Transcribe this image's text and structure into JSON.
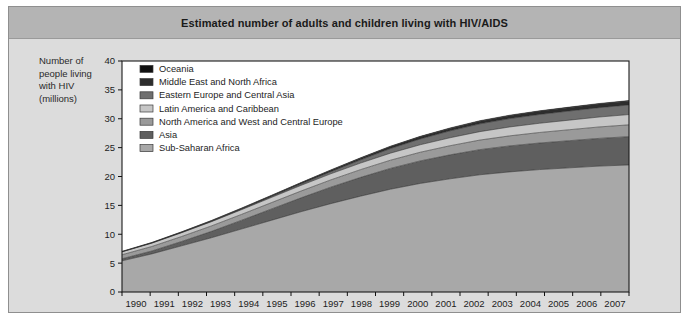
{
  "figure": {
    "title": "Estimated number of adults and children living with HIV/AIDS",
    "background_color": "#dcdcdc",
    "title_band_color": "#b4b4b4",
    "border_color": "#8f8f8f"
  },
  "axis": {
    "ylabel_line1": "Number of",
    "ylabel_line2": "people living",
    "ylabel_line3": "with HIV",
    "ylabel_line4": "(millions)",
    "xlabel": "Year"
  },
  "chart_data": {
    "type": "area",
    "stacked": true,
    "title": "Estimated number of adults and children living with HIV/AIDS",
    "xlabel": "Year",
    "ylabel": "Number of people living with HIV (millions)",
    "grid": false,
    "legend_position": "top-left inside plot",
    "categories": [
      1990,
      1991,
      1992,
      1993,
      1994,
      1995,
      1996,
      1997,
      1998,
      1999,
      2000,
      2001,
      2002,
      2003,
      2004,
      2005,
      2006,
      2007
    ],
    "xlim": [
      1990,
      2007
    ],
    "ylim": [
      0,
      40
    ],
    "yticks": [
      0,
      5,
      10,
      15,
      20,
      25,
      30,
      35,
      40
    ],
    "xticklabels": [
      "1990",
      "1991",
      "1992",
      "1993",
      "1994",
      "1995",
      "1996",
      "1997",
      "1998",
      "1999",
      "2000",
      "2001",
      "2002",
      "2003",
      "2004",
      "2005",
      "2006",
      "2007"
    ],
    "stack_order_bottom_to_top": [
      "Sub-Saharan Africa",
      "Asia",
      "North America and West and Central Europe",
      "Latin America and Caribbean",
      "Eastern Europe and Central Asia",
      "Middle East and North Africa",
      "Oceania"
    ],
    "series": [
      {
        "name": "Sub-Saharan Africa",
        "color": "#a8a8a8",
        "values": [
          5.4,
          6.6,
          8.0,
          9.4,
          10.9,
          12.4,
          13.9,
          15.3,
          16.6,
          17.8,
          18.8,
          19.6,
          20.3,
          20.8,
          21.2,
          21.5,
          21.8,
          22.0
        ]
      },
      {
        "name": "Asia",
        "color": "#5f5f5f",
        "values": [
          0.35,
          0.5,
          0.75,
          1.1,
          1.5,
          1.95,
          2.4,
          2.85,
          3.25,
          3.6,
          3.9,
          4.15,
          4.35,
          4.5,
          4.6,
          4.7,
          4.8,
          4.9
        ]
      },
      {
        "name": "North America and West and Central Europe",
        "color": "#9a9a9a",
        "values": [
          0.7,
          0.78,
          0.86,
          0.94,
          1.02,
          1.1,
          1.18,
          1.26,
          1.34,
          1.42,
          1.5,
          1.58,
          1.66,
          1.74,
          1.82,
          1.9,
          1.98,
          2.05
        ]
      },
      {
        "name": "Latin America and Caribbean",
        "color": "#c6c6c6",
        "values": [
          0.5,
          0.58,
          0.66,
          0.74,
          0.82,
          0.9,
          0.98,
          1.06,
          1.14,
          1.22,
          1.3,
          1.38,
          1.46,
          1.54,
          1.6,
          1.66,
          1.72,
          1.78
        ]
      },
      {
        "name": "Eastern Europe and Central Asia",
        "color": "#6f6f6f",
        "values": [
          0.02,
          0.03,
          0.04,
          0.06,
          0.09,
          0.14,
          0.22,
          0.35,
          0.55,
          0.8,
          1.0,
          1.2,
          1.35,
          1.45,
          1.52,
          1.58,
          1.62,
          1.66
        ]
      },
      {
        "name": "Middle East and North Africa",
        "color": "#2d2d2d",
        "values": [
          0.04,
          0.06,
          0.08,
          0.11,
          0.14,
          0.18,
          0.22,
          0.26,
          0.3,
          0.34,
          0.38,
          0.42,
          0.46,
          0.5,
          0.54,
          0.58,
          0.62,
          0.66
        ]
      },
      {
        "name": "Oceania",
        "color": "#111111",
        "values": [
          0.02,
          0.025,
          0.03,
          0.035,
          0.04,
          0.045,
          0.05,
          0.055,
          0.06,
          0.065,
          0.07,
          0.075,
          0.08,
          0.085,
          0.09,
          0.095,
          0.1,
          0.1
        ]
      }
    ],
    "legend_order_top_to_bottom": [
      {
        "label": "Oceania",
        "color": "#111111"
      },
      {
        "label": "Middle East and North Africa",
        "color": "#2d2d2d"
      },
      {
        "label": "Eastern Europe and Central Asia",
        "color": "#6f6f6f"
      },
      {
        "label": "Latin America and Caribbean",
        "color": "#c6c6c6"
      },
      {
        "label": "North America and West and Central Europe",
        "color": "#9a9a9a"
      },
      {
        "label": "Asia",
        "color": "#5f5f5f"
      },
      {
        "label": "Sub-Saharan Africa",
        "color": "#a8a8a8"
      }
    ]
  }
}
